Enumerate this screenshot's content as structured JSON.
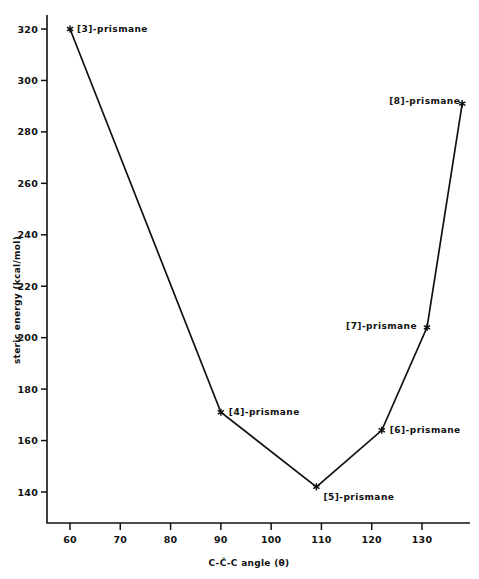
{
  "chart_data": {
    "type": "line",
    "title": "",
    "xlabel": "C-Ĉ-C angle (θ)",
    "ylabel": "steric energy (kcal/mol)",
    "xlim": [
      55,
      141
    ],
    "ylim": [
      132,
      327
    ],
    "xticks": [
      60,
      70,
      80,
      90,
      100,
      110,
      120,
      130
    ],
    "xtick_labels": [
      "60",
      "70",
      "80",
      "90",
      "100",
      "110",
      "120",
      "130"
    ],
    "yticks": [
      140,
      160,
      180,
      200,
      220,
      240,
      260,
      280,
      300,
      320
    ],
    "ytick_labels": [
      "140",
      "160",
      "180",
      "200",
      "220",
      "240",
      "260",
      "280",
      "300",
      "320"
    ],
    "grid": false,
    "legend": "none",
    "marker": "asterisk",
    "series": [
      {
        "name": "prismanes",
        "x": [
          60,
          90,
          109,
          122,
          131,
          138
        ],
        "values": [
          320,
          171,
          142,
          164,
          204,
          291
        ],
        "point_labels": [
          "[3]-prismane",
          "[4]-prismane",
          "[5]-prismane",
          "[6]-prismane",
          "[7]-prismane",
          "[8]-prismane"
        ]
      }
    ],
    "annotations": [
      {
        "text": "[3]-prismane",
        "x": 60,
        "y": 320,
        "anchor": "start",
        "dx": 7,
        "dy": 3
      },
      {
        "text": "[4]-prismane",
        "x": 90,
        "y": 171,
        "anchor": "start",
        "dx": 8,
        "dy": 3
      },
      {
        "text": "[5]-prismane",
        "x": 109,
        "y": 142,
        "anchor": "start",
        "dx": 7,
        "dy": 13
      },
      {
        "text": "[6]-prismane",
        "x": 122,
        "y": 164,
        "anchor": "start",
        "dx": 8,
        "dy": 3
      },
      {
        "text": "[7]-prismane",
        "x": 131,
        "y": 204,
        "anchor": "end",
        "dx": -10,
        "dy": 2
      },
      {
        "text": "[8]-prismane",
        "x": 138,
        "y": 291,
        "anchor": "end",
        "dx": -2,
        "dy": 0
      }
    ],
    "colors": {
      "line": "#111111",
      "marker": "#111111",
      "axis": "#111111",
      "background": "#ffffff"
    }
  }
}
